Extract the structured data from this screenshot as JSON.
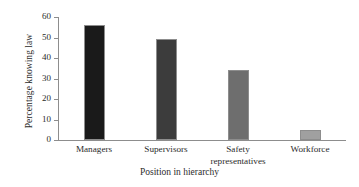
{
  "chart_data": {
    "type": "bar",
    "title": "",
    "xlabel": "Position in hierarchy",
    "ylabel": "Percentage knowing law",
    "categories": [
      "Managers",
      "Supervisors",
      "Safety\nrepresentatives",
      "Workforce"
    ],
    "values": [
      56,
      49.5,
      34,
      5
    ],
    "ylim": [
      0,
      60
    ],
    "yticks": [
      0,
      10,
      20,
      30,
      40,
      50,
      60
    ],
    "ytick_labels": [
      "0",
      "10",
      "20",
      "30",
      "40",
      "50",
      "60"
    ],
    "grid": false,
    "legend": null,
    "bar_colors": [
      "#1a1a1a",
      "#3c3c3c",
      "#6e6e6e",
      "#a0a0a0"
    ],
    "bar_edge_color": "#8d8d8d",
    "axis_color": "#8d8d8d",
    "background": "#ffffff",
    "series": [
      {
        "name": "Percentage knowing law",
        "values": [
          56,
          49.5,
          34,
          5
        ]
      }
    ]
  }
}
